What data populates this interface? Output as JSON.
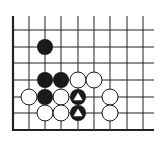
{
  "board": {
    "background": "#ffffff",
    "line_color": "#222222",
    "columns_x": [
      13,
      29,
      45,
      61,
      78,
      94,
      110,
      127,
      143
    ],
    "rows_y": [
      30,
      47,
      63,
      80,
      97,
      113,
      130
    ],
    "vertical_top_y": 16,
    "horizontal_right_x": 154,
    "left_edge": true,
    "bottom_edge": true,
    "stone_radius": 8
  },
  "stones": [
    {
      "color": "black",
      "col": 2,
      "row": 1,
      "marker": null
    },
    {
      "color": "black",
      "col": 2,
      "row": 3,
      "marker": null
    },
    {
      "color": "black",
      "col": 3,
      "row": 3,
      "marker": null
    },
    {
      "color": "white",
      "col": 4,
      "row": 3,
      "marker": null
    },
    {
      "color": "white",
      "col": 5,
      "row": 3,
      "marker": null
    },
    {
      "color": "white",
      "col": 1,
      "row": 4,
      "marker": null
    },
    {
      "color": "black",
      "col": 2,
      "row": 4,
      "marker": null
    },
    {
      "color": "white",
      "col": 3,
      "row": 4,
      "marker": null
    },
    {
      "color": "black",
      "col": 4,
      "row": 4,
      "marker": "triangle"
    },
    {
      "color": "white",
      "col": 6,
      "row": 4,
      "marker": null
    },
    {
      "color": "white",
      "col": 2,
      "row": 5,
      "marker": null
    },
    {
      "color": "white",
      "col": 3,
      "row": 5,
      "marker": null
    },
    {
      "color": "black",
      "col": 4,
      "row": 5,
      "marker": "triangle"
    },
    {
      "color": "white",
      "col": 6,
      "row": 5,
      "marker": null
    }
  ]
}
